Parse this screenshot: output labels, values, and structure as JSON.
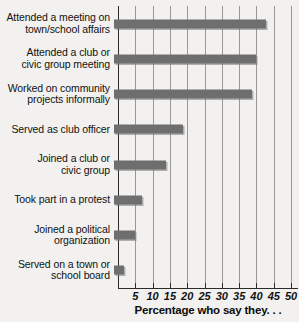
{
  "chart_data": {
    "type": "bar",
    "orientation": "horizontal",
    "title": "",
    "xlabel": "Percentage who say they. . .",
    "ylabel": "",
    "xlim": [
      0,
      52
    ],
    "xticks": [
      5,
      10,
      15,
      20,
      25,
      30,
      35,
      40,
      45,
      50
    ],
    "xtick_labels": [
      "5",
      "10",
      "15",
      "20",
      "25",
      "30",
      "35",
      "40",
      "45",
      "50"
    ],
    "grid": true,
    "legend": false,
    "bar_color": "#6e6e6e",
    "background_color": "#f2f1ef",
    "categories": [
      "Attended a meeting on\ntown/school affairs",
      "Attended a club or\ncivic group meeting",
      "Worked on community\nprojects informally",
      "Served as club officer",
      "Joined a club or\ncivic group",
      "Took part in a protest",
      "Joined a political\norganization",
      "Served on a town or\nschool board"
    ],
    "values": [
      44,
      41,
      40,
      20,
      15,
      8,
      6,
      3
    ]
  },
  "axis": {
    "title": "Percentage who say they. . ."
  }
}
